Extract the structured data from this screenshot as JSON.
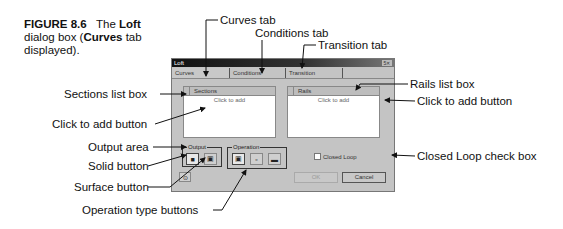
{
  "caption": {
    "figure": "FIGURE 8.6",
    "text_1": "The ",
    "bold_1": "Loft",
    "text_2": " dialog box (",
    "bold_2": "Curves",
    "text_3": " tab displayed)."
  },
  "dialog": {
    "title": "Loft",
    "title_controls": "5✕",
    "tabs": [
      {
        "label": "Curves",
        "active": true
      },
      {
        "label": "Conditions",
        "active": false
      },
      {
        "label": "Transition",
        "active": false
      }
    ],
    "sections": {
      "header": "Sections",
      "click_to_add": "Click to add"
    },
    "rails": {
      "header": "Rails",
      "click_to_add": "Click to add"
    },
    "output": {
      "label": "Output",
      "buttons": [
        "solid",
        "surface"
      ]
    },
    "operation": {
      "label": "Operation",
      "buttons": [
        "operation-1",
        "operation-2",
        "operation-3"
      ]
    },
    "closed_loop": {
      "label": "Closed Loop",
      "checked": false
    },
    "ok_label": "OK",
    "cancel_label": "Cancel"
  },
  "callouts": {
    "curves_tab": "Curves tab",
    "conditions_tab": "Conditions tab",
    "transition_tab": "Transition tab",
    "rails_list_box": "Rails list box",
    "rails_click_to_add": "Click to add button",
    "closed_loop": "Closed Loop check box",
    "sections_list_box": "Sections list box",
    "sections_click_to_add": "Click to add button",
    "output_area": "Output area",
    "solid_button": "Solid button",
    "surface_button": "Surface button",
    "operation_type_buttons": "Operation type buttons"
  }
}
